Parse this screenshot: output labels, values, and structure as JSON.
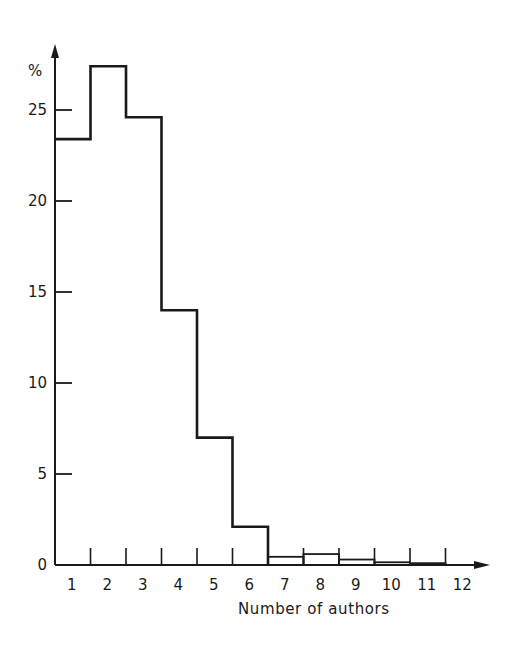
{
  "chart_data": {
    "type": "bar",
    "subtype": "histogram-step",
    "title": "",
    "xlabel": "Number of authors",
    "ylabel": "%",
    "categories": [
      "1",
      "2",
      "3",
      "4",
      "5",
      "6",
      "7",
      "8",
      "9",
      "10",
      "11",
      "12"
    ],
    "values": [
      23.4,
      27.4,
      24.6,
      14.0,
      7.0,
      2.1,
      0.45,
      0.6,
      0.3,
      0.15,
      0.1,
      null
    ],
    "ylim": [
      0,
      28
    ],
    "yticks": [
      0,
      5,
      10,
      15,
      20,
      25
    ],
    "grid": false,
    "legend": null
  },
  "labels": {
    "ylabel": "%",
    "xlabel": "Number of authors",
    "yticks": [
      "0",
      "5",
      "10",
      "15",
      "20",
      "25"
    ],
    "xticks": [
      "1",
      "2",
      "3",
      "4",
      "5",
      "6",
      "7",
      "8",
      "9",
      "10",
      "11",
      "12"
    ]
  },
  "colors": {
    "line": "#1a1a1a",
    "background": "#ffffff"
  }
}
